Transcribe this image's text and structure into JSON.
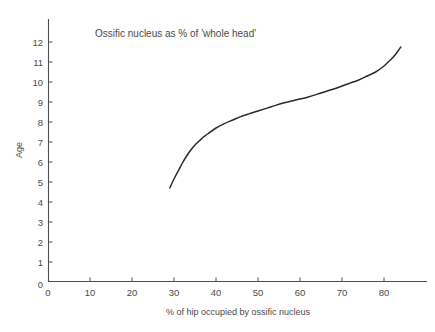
{
  "chart_data": {
    "type": "line",
    "title": "Ossific nucleus as % of 'whole head'",
    "xlabel": "% of hip occupied by ossific nucleus",
    "ylabel": "Age",
    "xlim": [
      0,
      89
    ],
    "ylim": [
      0,
      13
    ],
    "xticks": [
      0,
      10,
      20,
      30,
      40,
      50,
      60,
      70,
      80
    ],
    "yticks": [
      0,
      1,
      2,
      3,
      4,
      5,
      6,
      7,
      8,
      9,
      10,
      11,
      12
    ],
    "xtick_labels": [
      "0",
      "10",
      "20",
      "30",
      "40",
      "50",
      "60",
      "70",
      "80"
    ],
    "ytick_labels": [
      "0",
      "1",
      "2",
      "3",
      "4",
      "5",
      "6",
      "7",
      "8",
      "9",
      "10",
      "11",
      "12"
    ],
    "grid": false,
    "legend": false,
    "legend_position": "none",
    "line_color": "#2b2b2b",
    "axis_color": "#4f4f4f",
    "background_color": "#ffffff",
    "series": [
      {
        "name": "Age vs % of hip occupied by ossific nucleus",
        "x": [
          29.0,
          30.0,
          31.0,
          32.0,
          33.0,
          34.0,
          35.0,
          36.0,
          37.0,
          38.0,
          40.0,
          42.0,
          44.0,
          46.0,
          48.0,
          50.0,
          53.0,
          56.0,
          59.0,
          62.0,
          65.0,
          68.0,
          70.0,
          72.0,
          74.0,
          76.0,
          78.0,
          80.0,
          81.0,
          82.0,
          83.0,
          84.0
        ],
        "y": [
          4.7,
          5.15,
          5.55,
          5.95,
          6.3,
          6.6,
          6.85,
          7.05,
          7.25,
          7.4,
          7.7,
          7.92,
          8.1,
          8.28,
          8.42,
          8.55,
          8.75,
          8.95,
          9.1,
          9.25,
          9.45,
          9.65,
          9.8,
          9.95,
          10.1,
          10.3,
          10.5,
          10.8,
          11.0,
          11.2,
          11.45,
          11.75
        ]
      }
    ],
    "annotations": []
  },
  "figure": {
    "title_text": "Ossific nucleus as % of 'whole head'",
    "x_axis_label": "% of hip occupied by ossific nucleus",
    "y_axis_label": "Age"
  }
}
